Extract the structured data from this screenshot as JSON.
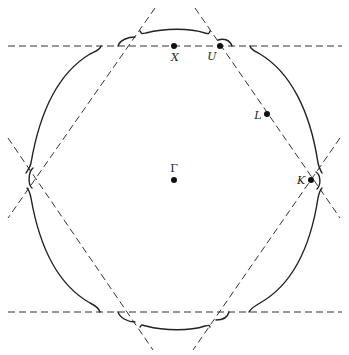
{
  "figure": {
    "points": [
      {
        "id": "gamma",
        "label": "Γ",
        "x": 174,
        "y": 180,
        "lx": 174,
        "ly": 171,
        "anchor": "middle"
      },
      {
        "id": "x",
        "label": "X",
        "x": 174,
        "y": 46,
        "lx": 175,
        "ly": 61,
        "anchor": "middle"
      },
      {
        "id": "u",
        "label": "U",
        "x": 220,
        "y": 46,
        "lx": 212,
        "ly": 60,
        "anchor": "middle"
      },
      {
        "id": "l",
        "label": "L",
        "x": 267,
        "y": 114,
        "lx": 258,
        "ly": 119,
        "anchor": "middle"
      },
      {
        "id": "k",
        "label": "K",
        "x": 311,
        "y": 180,
        "lx": 301,
        "ly": 184,
        "anchor": "middle"
      }
    ],
    "colors": {
      "ink": "#222222",
      "background": "#ffffff"
    }
  }
}
